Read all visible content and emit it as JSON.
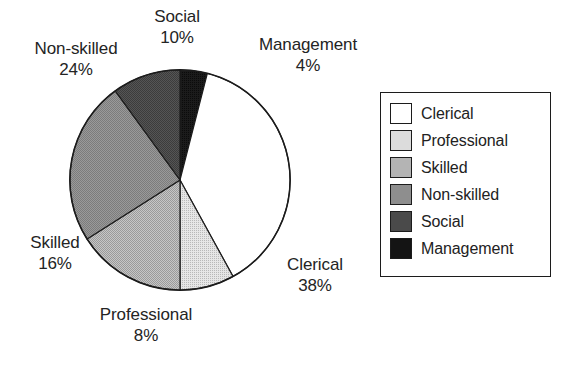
{
  "chart_data": {
    "type": "pie",
    "title": "",
    "categories": [
      "Clerical",
      "Professional",
      "Skilled",
      "Non-skilled",
      "Social",
      "Management"
    ],
    "values": [
      38,
      8,
      16,
      24,
      10,
      4
    ],
    "value_unit": "%",
    "start_angle_deg": 0,
    "direction": "clockwise",
    "slice_order_clockwise_from_top": [
      "Management",
      "Clerical",
      "Professional",
      "Skilled",
      "Non-skilled",
      "Social"
    ],
    "legend_position": "right",
    "grid": false,
    "colors": [
      "#ffffff",
      "#dcdcdc",
      "#b4b4b4",
      "#8e8e8e",
      "#4a4a4a",
      "#141414"
    ],
    "outline_color": "#1c1c1c",
    "slices": [
      {
        "label": "Clerical",
        "value": 38,
        "pct_text": "38%",
        "color": "#ffffff"
      },
      {
        "label": "Professional",
        "value": 8,
        "pct_text": "8%",
        "color": "#dcdcdc"
      },
      {
        "label": "Skilled",
        "value": 16,
        "pct_text": "16%",
        "color": "#b4b4b4"
      },
      {
        "label": "Non-skilled",
        "value": 24,
        "pct_text": "24%",
        "color": "#8e8e8e"
      },
      {
        "label": "Social",
        "value": 10,
        "pct_text": "10%",
        "color": "#4a4a4a"
      },
      {
        "label": "Management",
        "value": 4,
        "pct_text": "4%",
        "color": "#141414"
      }
    ]
  },
  "labels": {
    "social": {
      "name": "Social",
      "pct": "10%"
    },
    "management": {
      "name": "Management",
      "pct": "4%"
    },
    "nonskilled": {
      "name": "Non-skilled",
      "pct": "24%"
    },
    "skilled": {
      "name": "Skilled",
      "pct": "16%"
    },
    "professional": {
      "name": "Professional",
      "pct": "8%"
    },
    "clerical": {
      "name": "Clerical",
      "pct": "38%"
    }
  },
  "legend": {
    "items": [
      {
        "label": "Clerical",
        "color": "#ffffff"
      },
      {
        "label": "Professional",
        "color": "#dcdcdc"
      },
      {
        "label": "Skilled",
        "color": "#b4b4b4"
      },
      {
        "label": "Non-skilled",
        "color": "#8e8e8e"
      },
      {
        "label": "Social",
        "color": "#4a4a4a"
      },
      {
        "label": "Management",
        "color": "#141414"
      }
    ]
  }
}
